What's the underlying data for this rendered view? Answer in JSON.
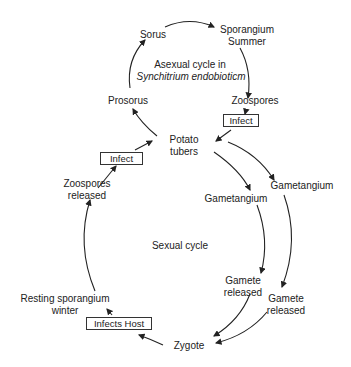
{
  "diagram": {
    "asexual_title_line1": "Asexual cycle in",
    "asexual_title_line2": "Synchitrium endobioticm",
    "sexual_title": "Sexual cycle",
    "nodes": {
      "sorus": "Sorus",
      "sporangium_summer_1": "Sporangium",
      "sporangium_summer_2": "Summer",
      "zoospores": "Zoospores",
      "prosorus": "Prosorus",
      "potato_tubers_1": "Potato",
      "potato_tubers_2": "tubers",
      "zoospores_released_1": "Zoospores",
      "zoospores_released_2": "released",
      "gametangium_left": "Gametangium",
      "gametangium_right": "Gametangium",
      "gamete_released_left_1": "Gamete",
      "gamete_released_left_2": "released",
      "gamete_released_right_1": "Gamete",
      "gamete_released_right_2": "released",
      "resting_sporangium_1": "Resting sporangium",
      "resting_sporangium_2": "winter",
      "zygote": "Zygote"
    },
    "boxes": {
      "infect_right": "Infect",
      "infect_left": "Infect",
      "infects_host": "Infects Host"
    }
  }
}
